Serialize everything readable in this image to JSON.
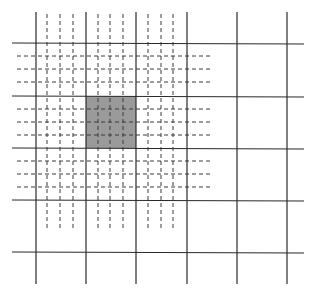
{
  "diagram": {
    "colors": {
      "background": "#ffffff",
      "solid_line": "#2a2a2a",
      "dashed_line": "#3a3a3a",
      "shaded_cell": "#9a9a9a"
    },
    "solid_grid": {
      "vertical_x": [
        36,
        86,
        136,
        187,
        237,
        287
      ],
      "vertical_y_range": [
        12,
        284
      ],
      "horizontal_y": [
        43,
        96,
        148,
        200,
        252
      ],
      "horizontal_x_range": [
        12,
        304
      ]
    },
    "dashed_grid": {
      "vertical_x": [
        47,
        60,
        73,
        98,
        110,
        123,
        148,
        161,
        173
      ],
      "vertical_y_range": [
        14,
        228
      ],
      "horizontal_y": [
        56,
        69,
        82,
        109,
        122,
        135,
        161,
        174,
        187
      ],
      "horizontal_x_range": [
        17,
        212
      ],
      "dash": "4 3"
    },
    "shaded_cell": {
      "x": 86,
      "y": 96,
      "width": 50,
      "height": 52
    }
  }
}
